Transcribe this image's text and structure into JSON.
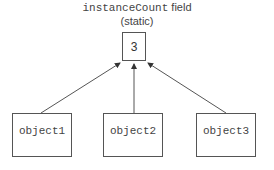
{
  "title": {
    "field_name": "instanceCount",
    "field_suffix": " field",
    "qualifier": "(static)"
  },
  "counter": {
    "value": "3"
  },
  "objects": [
    {
      "label": "object1"
    },
    {
      "label": "object2"
    },
    {
      "label": "object3"
    }
  ]
}
